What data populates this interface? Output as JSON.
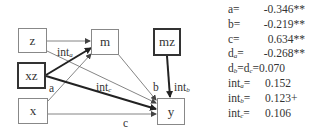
{
  "diagram": {
    "nodes": [
      {
        "id": "z",
        "label": "z",
        "emphasized": false
      },
      {
        "id": "xz",
        "label": "xz",
        "emphasized": true
      },
      {
        "id": "x",
        "label": "x",
        "emphasized": false
      },
      {
        "id": "m",
        "label": "m",
        "emphasized": false
      },
      {
        "id": "mz",
        "label": "mz",
        "emphasized": true
      },
      {
        "id": "y",
        "label": "y",
        "emphasized": false
      }
    ],
    "edges": [
      {
        "from": "z",
        "to": "m",
        "label": "",
        "emphasized": false
      },
      {
        "from": "z",
        "to": "y",
        "label": "",
        "emphasized": false
      },
      {
        "from": "xz",
        "to": "m",
        "label": "int_a",
        "emphasized": true
      },
      {
        "from": "xz",
        "to": "y",
        "label": "int_c",
        "emphasized": true
      },
      {
        "from": "x",
        "to": "m",
        "label": "a",
        "emphasized": false
      },
      {
        "from": "x",
        "to": "y",
        "label": "c",
        "emphasized": false
      },
      {
        "from": "m",
        "to": "y",
        "label": "b",
        "emphasized": false
      },
      {
        "from": "mz",
        "to": "y",
        "label": "int_b",
        "emphasized": true
      }
    ],
    "edge_labels": {
      "int_a": {
        "base": "int",
        "sub": "a"
      },
      "int_b": {
        "base": "int",
        "sub": "b"
      },
      "int_c": {
        "base": "int",
        "sub": "c"
      },
      "a": "a",
      "b": "b",
      "c": "c"
    }
  },
  "stats": [
    {
      "key": "a",
      "sub": "",
      "suffix": "=",
      "value": "-0.346**"
    },
    {
      "key": "b",
      "sub": "",
      "suffix": "=",
      "value": "-0.219**"
    },
    {
      "key": "c",
      "sub": "",
      "suffix": "=",
      "value": "0.634**"
    },
    {
      "key": "d",
      "sub": "a",
      "suffix": "=",
      "value": "-0.268**"
    },
    {
      "key": "d",
      "sub": "b",
      "suffix": "=d",
      "sub2": "c",
      "suffix2": "=",
      "value": "0.070"
    },
    {
      "key": "int",
      "sub": "a",
      "suffix": "=",
      "value": "0.152"
    },
    {
      "key": "int",
      "sub": "b",
      "suffix": "=",
      "value": "0.123+"
    },
    {
      "key": "int",
      "sub": "c",
      "suffix": "=",
      "value": "0.106"
    }
  ]
}
